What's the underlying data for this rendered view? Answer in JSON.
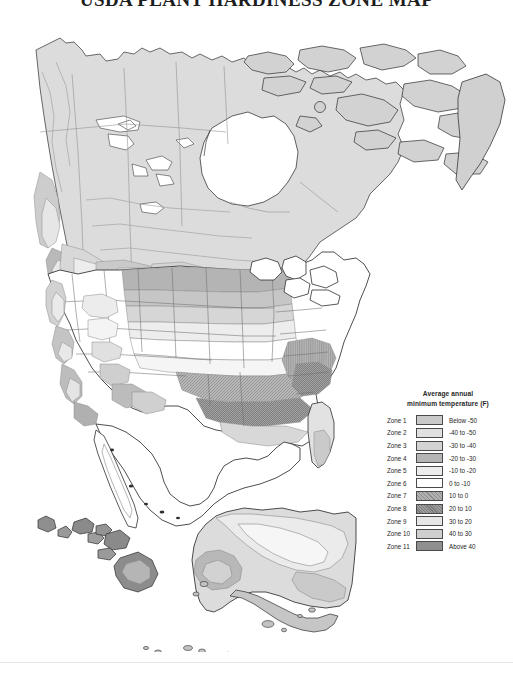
{
  "title": "USDA PLANT HARDINESS ZONE MAP",
  "legend": {
    "title_line1": "Average annual",
    "title_line2": "minimum temperature (F)",
    "rows": [
      {
        "zone": "Zone 1",
        "range": "Below -50",
        "fill": "#c9c9c9",
        "pattern": "solid"
      },
      {
        "zone": "Zone 2",
        "range": "-40 to -50",
        "fill": "#e0e0e0",
        "pattern": "solid"
      },
      {
        "zone": "Zone 3",
        "range": "-30 to -40",
        "fill": "#d3d3d3",
        "pattern": "solid"
      },
      {
        "zone": "Zone 4",
        "range": "-20 to -30",
        "fill": "#b5b5b5",
        "pattern": "solid"
      },
      {
        "zone": "Zone 5",
        "range": "-10 to -20",
        "fill": "#ececec",
        "pattern": "solid"
      },
      {
        "zone": "Zone 6",
        "range": "0 to -10",
        "fill": "#ffffff",
        "pattern": "solid"
      },
      {
        "zone": "Zone 7",
        "range": "10 to 0",
        "fill": "#b0b0b0",
        "pattern": "hatch"
      },
      {
        "zone": "Zone 8",
        "range": "20 to 10",
        "fill": "#9e9e9e",
        "pattern": "hatch-dense"
      },
      {
        "zone": "Zone 9",
        "range": "30 to 20",
        "fill": "#e6e6e6",
        "pattern": "solid"
      },
      {
        "zone": "Zone 10",
        "range": "40 to 30",
        "fill": "#cfcfcf",
        "pattern": "solid"
      },
      {
        "zone": "Zone 11",
        "range": "Above 40",
        "fill": "#8f8f8f",
        "pattern": "solid"
      }
    ]
  },
  "map": {
    "regions": [
      {
        "name": "canada-mainland"
      },
      {
        "name": "arctic-archipelago"
      },
      {
        "name": "greenland-edge"
      },
      {
        "name": "united-states-lower-48"
      },
      {
        "name": "mexico-northern"
      },
      {
        "name": "alaska-inset"
      },
      {
        "name": "hawaii-inset"
      },
      {
        "name": "great-lakes"
      },
      {
        "name": "hudson-bay"
      }
    ]
  }
}
